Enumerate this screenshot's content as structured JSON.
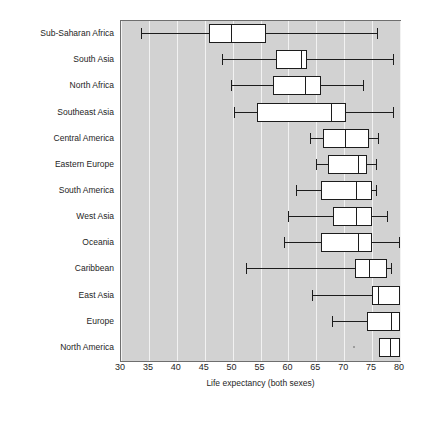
{
  "chart_data": {
    "type": "boxplot",
    "title": "",
    "xlabel": "Life expectancy (both sexes)",
    "ylabel": "",
    "xlim": [
      30,
      80
    ],
    "xticks": [
      30,
      35,
      40,
      45,
      50,
      55,
      60,
      65,
      70,
      75,
      80
    ],
    "grid": "vertical",
    "legend": "none",
    "orientation": "horizontal",
    "categories": [
      "Sub-Saharan Africa",
      "South Asia",
      "North Africa",
      "Southeast Asia",
      "Central America",
      "Eastern Europe",
      "South America",
      "West Asia",
      "Oceania",
      "Caribbean",
      "East Asia",
      "Europe",
      "North America"
    ],
    "boxes": [
      {
        "category": "Sub-Saharan Africa",
        "whisker_low": 33.6,
        "q1": 45.8,
        "median": 49.7,
        "q3": 56.0,
        "whisker_high": 76.1,
        "outliers": []
      },
      {
        "category": "South Asia",
        "whisker_low": 48.1,
        "q1": 57.8,
        "median": 62.3,
        "q3": 63.4,
        "whisker_high": 79.0,
        "outliers": []
      },
      {
        "category": "North Africa",
        "whisker_low": 49.7,
        "q1": 57.3,
        "median": 63.0,
        "q3": 65.9,
        "whisker_high": 73.5,
        "outliers": []
      },
      {
        "category": "Southeast Asia",
        "whisker_low": 50.2,
        "q1": 54.4,
        "median": 67.7,
        "q3": 70.4,
        "whisker_high": 79.0,
        "outliers": []
      },
      {
        "category": "Central America",
        "whisker_low": 63.9,
        "q1": 66.2,
        "median": 70.2,
        "q3": 74.5,
        "whisker_high": 76.3,
        "outliers": []
      },
      {
        "category": "Eastern Europe",
        "whisker_low": 64.9,
        "q1": 67.1,
        "median": 72.5,
        "q3": 74.1,
        "whisker_high": 75.8,
        "outliers": []
      },
      {
        "category": "South America",
        "whisker_low": 61.4,
        "q1": 65.9,
        "median": 72.2,
        "q3": 74.9,
        "whisker_high": 75.9,
        "outliers": []
      },
      {
        "category": "West Asia",
        "whisker_low": 60.0,
        "q1": 68.0,
        "median": 72.1,
        "q3": 74.9,
        "whisker_high": 77.8,
        "outliers": []
      },
      {
        "category": "Oceania",
        "whisker_low": 59.2,
        "q1": 65.9,
        "median": 72.5,
        "q3": 74.9,
        "whisker_high": 80.0,
        "outliers": []
      },
      {
        "category": "Caribbean",
        "whisker_low": 52.4,
        "q1": 72.0,
        "median": 74.5,
        "q3": 77.6,
        "whisker_high": 78.5,
        "outliers": []
      },
      {
        "category": "East Asia",
        "whisker_low": 64.2,
        "q1": 74.9,
        "median": 76.0,
        "q3": 80.0,
        "whisker_high": 80.0,
        "outliers": []
      },
      {
        "category": "Europe",
        "whisker_low": 67.8,
        "q1": 74.1,
        "median": 78.4,
        "q3": 80.0,
        "whisker_high": 80.0,
        "outliers": []
      },
      {
        "category": "North America",
        "whisker_low": 76.3,
        "q1": 76.3,
        "median": 78.2,
        "q3": 80.0,
        "whisker_high": 80.0,
        "outliers": [
          71.5
        ]
      }
    ]
  },
  "colors": {
    "plot_background": "#d2d2d2",
    "gridline": "#f2f2f2",
    "box_fill": "#ffffff",
    "box_stroke": "#1c1c1c",
    "axis": "#6e6e6e",
    "text": "#1e1e1e",
    "page_background": "#ffffff"
  }
}
